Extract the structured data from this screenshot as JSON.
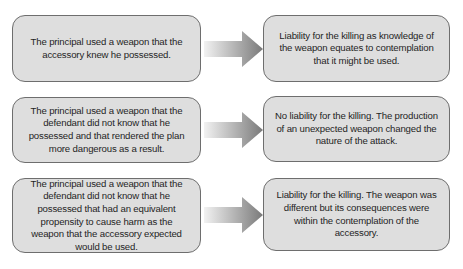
{
  "rows": [
    {
      "scenario": "The principal used a weapon that the accessory knew he possessed.",
      "outcome": "Liability for the killing as knowledge of the weapon equates to contemplation that it might be used."
    },
    {
      "scenario": "The principal used a weapon that the defendant did not know that he possessed and that rendered the plan more dangerous as a result.",
      "outcome": "No liability for the killing. The production of an unexpected weapon changed the nature of the attack."
    },
    {
      "scenario": "The principal used a weapon that the defendant did not know that he possessed that had an equivalent propensity to cause harm as the weapon that the accessory expected would be used.",
      "outcome": "Liability for the killing. The weapon was different but its consequences were within the contemplation of the accessory."
    }
  ],
  "colors": {
    "box_fill": "#dedede",
    "box_border": "#6e6e6e",
    "arrow_start": "#f2f2f2",
    "arrow_end": "#7a7a7a",
    "text": "#1e1e1e"
  },
  "icons": {
    "connector": "right-arrow-icon"
  }
}
